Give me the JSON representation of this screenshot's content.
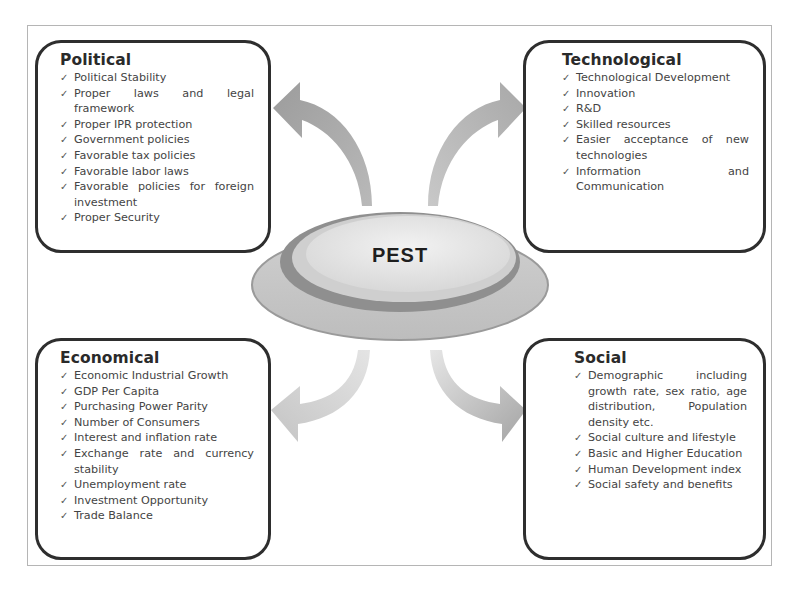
{
  "center": {
    "label": "PEST"
  },
  "colors": {
    "box_border": "#2e2e2e",
    "frame_border": "#b5b5b5",
    "arrow_fill": "#a9a9a9",
    "disc_rim": "#8c8c8c",
    "disc_top": "#e6e6e6",
    "text": "#444444"
  },
  "quadrants": {
    "political": {
      "title": "Political",
      "items": [
        "Political Stability",
        "Proper laws and legal framework",
        "Proper IPR protection",
        "Government policies",
        "Favorable tax policies",
        "Favorable labor laws",
        "Favorable policies for foreign investment",
        "Proper Security"
      ]
    },
    "technological": {
      "title": "Technological",
      "items": [
        "Technological Development",
        "Innovation",
        "R&D",
        "Skilled resources",
        "Easier acceptance of new technologies",
        "Information and Communication"
      ]
    },
    "economical": {
      "title": "Economical",
      "items": [
        "Economic Industrial Growth",
        "GDP Per Capita",
        "Purchasing Power Parity",
        "Number of Consumers",
        "Interest and inflation rate",
        "Exchange rate and currency stability",
        "Unemployment rate",
        "Investment Opportunity",
        "Trade Balance"
      ]
    },
    "social": {
      "title": "Social",
      "items": [
        "Demographic including growth rate, sex ratio, age distribution, Population density etc.",
        "Social culture and lifestyle",
        "Basic and Higher Education",
        "Human Development index",
        "Social safety and benefits"
      ]
    }
  },
  "icons": {
    "bullet": "check-icon",
    "arrows": [
      "arrow-up-left-icon",
      "arrow-up-right-icon",
      "arrow-down-left-icon",
      "arrow-down-right-icon"
    ]
  }
}
